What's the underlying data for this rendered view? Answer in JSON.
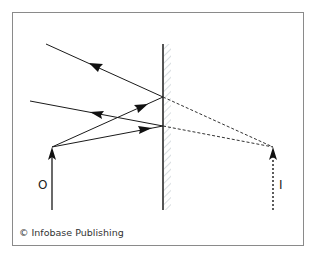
{
  "diagram": {
    "type": "plane-mirror-reflection",
    "labels": {
      "object": "O",
      "image": "I"
    },
    "credit": "© Infobase Publishing",
    "colors": {
      "line": "#1a1a1a",
      "frame": "#888888",
      "mirror": "#555555",
      "hatch": "#d8dde0"
    },
    "geometry": {
      "frame": {
        "x": 12,
        "y": 12,
        "w": 292,
        "h": 234
      },
      "mirror": {
        "x": 163,
        "y1": 44,
        "y2": 210
      },
      "object": {
        "x": 52,
        "base_y": 210,
        "tip_y": 147
      },
      "image": {
        "x": 273,
        "base_y": 210,
        "tip_y": 147
      },
      "reflection_points": [
        [
          163,
          97
        ],
        [
          163,
          126
        ]
      ],
      "reflected_ray_ends": [
        [
          46,
          44
        ],
        [
          30,
          101
        ]
      ]
    }
  }
}
